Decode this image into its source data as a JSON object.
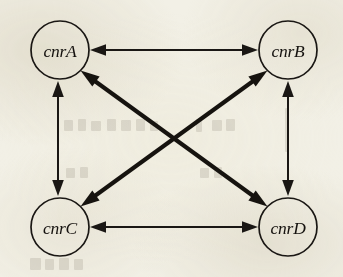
{
  "figure": {
    "kind": "node-link-diagram",
    "background_color": "#f2f0e6",
    "ink_color": "#1a1714",
    "width": 343,
    "height": 277
  },
  "nodes": [
    {
      "id": "cnrA",
      "label": "cnrA",
      "cx": 60,
      "cy": 50,
      "r": 29
    },
    {
      "id": "cnrB",
      "label": "cnrB",
      "cx": 288,
      "cy": 50,
      "r": 29
    },
    {
      "id": "cnrC",
      "label": "cnrC",
      "cx": 60,
      "cy": 227,
      "r": 29
    },
    {
      "id": "cnrD",
      "label": "cnrD",
      "cx": 288,
      "cy": 227,
      "r": 29
    }
  ],
  "edges": [
    {
      "id": "edge-cnrA-cnrB",
      "from": "cnrA",
      "to": "cnrB",
      "direction": "bidirectional",
      "orientation": "horizontal",
      "weight": "thin"
    },
    {
      "id": "edge-cnrC-cnrD",
      "from": "cnrC",
      "to": "cnrD",
      "direction": "bidirectional",
      "orientation": "horizontal",
      "weight": "thin"
    },
    {
      "id": "edge-cnrA-cnrC",
      "from": "cnrA",
      "to": "cnrC",
      "direction": "bidirectional",
      "orientation": "vertical",
      "weight": "thin"
    },
    {
      "id": "edge-cnrB-cnrD",
      "from": "cnrB",
      "to": "cnrD",
      "direction": "bidirectional",
      "orientation": "vertical",
      "weight": "thin"
    },
    {
      "id": "edge-cnrA-cnrD",
      "from": "cnrA",
      "to": "cnrD",
      "direction": "bidirectional",
      "orientation": "diagonal",
      "weight": "thick"
    },
    {
      "id": "edge-cnrC-cnrB",
      "from": "cnrC",
      "to": "cnrB",
      "direction": "bidirectional",
      "orientation": "diagonal",
      "weight": "thick"
    }
  ]
}
